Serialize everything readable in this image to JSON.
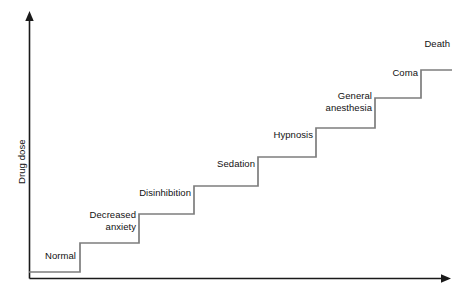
{
  "chart_data": {
    "type": "line",
    "title": "",
    "xlabel": "",
    "ylabel": "Drug dose",
    "grid": false,
    "legend": false,
    "axes": {
      "x_arrow": true,
      "y_arrow": true,
      "x_ticks": [],
      "y_ticks": []
    },
    "categories": [
      "Normal",
      "Decreased anxiety",
      "Disinhibition",
      "Sedation",
      "Hypnosis",
      "General anesthesia",
      "Coma",
      "Death"
    ],
    "values": [
      1,
      2,
      3,
      4,
      5,
      6,
      7,
      8
    ],
    "steps": [
      {
        "index": 0,
        "label": "Normal",
        "label_lines": "Normal",
        "level": 1,
        "x_start": 29,
        "x_end": 80,
        "y": 272,
        "label_x": 29,
        "label_y": 250,
        "label_width": 47
      },
      {
        "index": 1,
        "label": "Decreased anxiety",
        "label_lines": "Decreased\nanxiety",
        "level": 2,
        "x_start": 80,
        "x_end": 139,
        "y": 243,
        "label_x": 64,
        "label_y": 209,
        "label_width": 72
      },
      {
        "index": 2,
        "label": "Disinhibition",
        "label_lines": "Disinhibition",
        "level": 3,
        "x_start": 139,
        "x_end": 194,
        "y": 214,
        "label_x": 121,
        "label_y": 187,
        "label_width": 70
      },
      {
        "index": 3,
        "label": "Sedation",
        "label_lines": "Sedation",
        "level": 4,
        "x_start": 194,
        "x_end": 258,
        "y": 186,
        "label_x": 196,
        "label_y": 158,
        "label_width": 59
      },
      {
        "index": 4,
        "label": "Hypnosis",
        "label_lines": "Hypnosis",
        "level": 5,
        "x_start": 258,
        "x_end": 316,
        "y": 157,
        "label_x": 256,
        "label_y": 129,
        "label_width": 57
      },
      {
        "index": 5,
        "label": "General anesthesia",
        "label_lines": "General\nanesthesia",
        "level": 6,
        "x_start": 316,
        "x_end": 375,
        "y": 128,
        "label_x": 300,
        "label_y": 90,
        "label_width": 72
      },
      {
        "index": 6,
        "label": "Coma",
        "label_lines": "Coma",
        "level": 7,
        "x_start": 375,
        "x_end": 421,
        "y": 98,
        "label_x": 376,
        "label_y": 67,
        "label_width": 42
      },
      {
        "index": 7,
        "label": "Death",
        "label_lines": "Death",
        "level": 8,
        "x_start": 421,
        "x_end": 452,
        "y": 70,
        "label_x": 408,
        "label_y": 38,
        "label_width": 42
      }
    ]
  },
  "colors": {
    "axis": "#1a1a1a",
    "step_line": "#7d7d7d",
    "text": "#111111",
    "background": "#ffffff"
  },
  "geometry": {
    "y_axis_x": 29.5,
    "y_axis_top": 16,
    "x_axis_y": 278.5,
    "x_axis_right": 448
  }
}
